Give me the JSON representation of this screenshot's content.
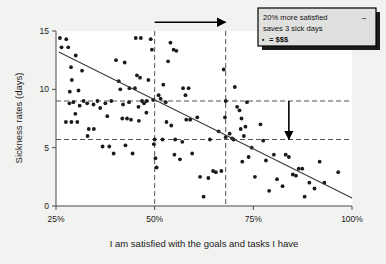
{
  "chart_data": {
    "type": "scatter",
    "title": "",
    "xlabel": "I am satisfied with the goals and tasks I have",
    "ylabel": "Sickness rates (days)",
    "xlim": [
      25,
      100
    ],
    "ylim": [
      0,
      15
    ],
    "xticks": [
      25,
      50,
      75,
      100
    ],
    "xtick_labels": [
      "25%",
      "50%",
      "75%",
      "100%"
    ],
    "yticks": [
      0,
      5,
      10,
      15
    ],
    "ytick_labels": [
      "0",
      "5",
      "10",
      "15"
    ],
    "grid": false,
    "legend": "none",
    "trendline": {
      "name": "linear fit",
      "x": [
        25.7,
        100.0
      ],
      "y": [
        13.2,
        0.68
      ]
    },
    "reference_lines": {
      "horizontal": [
        {
          "y": 9.0,
          "style": "dashed"
        },
        {
          "y": 5.7,
          "style": "dashed"
        }
      ],
      "vertical": [
        {
          "x": 50.0,
          "style": "dashed"
        },
        {
          "x": 68.0,
          "style": "dashed"
        }
      ]
    },
    "annotations": [
      {
        "name": "horizontal-arrow",
        "from": [
          50.0,
          15.75
        ],
        "to": [
          68.0,
          15.75
        ],
        "direction": "right"
      },
      {
        "name": "vertical-arrow",
        "from": [
          84.0,
          9.0
        ],
        "to": [
          84.0,
          5.7
        ],
        "direction": "down"
      }
    ],
    "points": [
      [
        26.0,
        14.4
      ],
      [
        27.6,
        14.3
      ],
      [
        26.4,
        13.6
      ],
      [
        28.1,
        13.6
      ],
      [
        28.8,
        11.9
      ],
      [
        30.0,
        12.9
      ],
      [
        31.6,
        11.6
      ],
      [
        29.0,
        10.8
      ],
      [
        28.5,
        9.8
      ],
      [
        30.7,
        9.9
      ],
      [
        29.4,
        8.9
      ],
      [
        31.0,
        8.6
      ],
      [
        28.4,
        8.8
      ],
      [
        29.9,
        7.9
      ],
      [
        27.5,
        7.2
      ],
      [
        28.9,
        7.2
      ],
      [
        30.4,
        7.2
      ],
      [
        32.9,
        8.8
      ],
      [
        34.5,
        8.7
      ],
      [
        33.3,
        6.6
      ],
      [
        34.6,
        6.6
      ],
      [
        33.0,
        6.0
      ],
      [
        36.2,
        8.4
      ],
      [
        37.5,
        8.8
      ],
      [
        38.0,
        7.7
      ],
      [
        36.8,
        5.1
      ],
      [
        38.5,
        5.1
      ],
      [
        39.6,
        4.5
      ],
      [
        40.2,
        12.5
      ],
      [
        41.3,
        10.0
      ],
      [
        42.4,
        12.3
      ],
      [
        40.9,
        10.7
      ],
      [
        42.0,
        8.7
      ],
      [
        43.6,
        10.1
      ],
      [
        41.8,
        7.5
      ],
      [
        43.0,
        7.5
      ],
      [
        44.0,
        7.4
      ],
      [
        42.6,
        5.2
      ],
      [
        44.4,
        4.5
      ],
      [
        45.2,
        14.4
      ],
      [
        46.5,
        14.4
      ],
      [
        45.5,
        11.2
      ],
      [
        46.3,
        11.0
      ],
      [
        45.0,
        10.1
      ],
      [
        46.8,
        9.0
      ],
      [
        45.9,
        8.5
      ],
      [
        47.3,
        8.8
      ],
      [
        46.0,
        7.3
      ],
      [
        47.9,
        8.0
      ],
      [
        48.4,
        10.8
      ],
      [
        49.0,
        14.3
      ],
      [
        49.3,
        13.4
      ],
      [
        49.6,
        9.1
      ],
      [
        50.0,
        5.7
      ],
      [
        49.8,
        5.3
      ],
      [
        50.2,
        4.1
      ],
      [
        50.5,
        3.3
      ],
      [
        51.0,
        9.5
      ],
      [
        52.2,
        10.4
      ],
      [
        51.5,
        9.2
      ],
      [
        52.8,
        8.9
      ],
      [
        53.4,
        12.4
      ],
      [
        54.0,
        14.0
      ],
      [
        54.8,
        13.4
      ],
      [
        55.5,
        13.3
      ],
      [
        53.0,
        7.2
      ],
      [
        54.2,
        6.9
      ],
      [
        55.0,
        4.4
      ],
      [
        56.4,
        4.0
      ],
      [
        57.2,
        10.1
      ],
      [
        58.6,
        10.1
      ],
      [
        57.8,
        9.5
      ],
      [
        58.0,
        7.4
      ],
      [
        57.0,
        5.5
      ],
      [
        59.5,
        4.5
      ],
      [
        60.8,
        7.6
      ],
      [
        61.5,
        2.5
      ],
      [
        62.4,
        0.8
      ],
      [
        63.6,
        2.4
      ],
      [
        64.8,
        3.0
      ],
      [
        65.5,
        2.9
      ],
      [
        66.2,
        6.4
      ],
      [
        66.9,
        3.0
      ],
      [
        67.5,
        11.7
      ],
      [
        68.0,
        9.0
      ],
      [
        68.0,
        5.9
      ],
      [
        67.8,
        7.6
      ],
      [
        69.0,
        6.2
      ],
      [
        69.6,
        5.8
      ],
      [
        70.3,
        10.2
      ],
      [
        70.9,
        8.5
      ],
      [
        71.5,
        8.2
      ],
      [
        72.0,
        7.5
      ],
      [
        71.8,
        6.6
      ],
      [
        72.6,
        6.0
      ],
      [
        73.4,
        8.9
      ],
      [
        73.0,
        6.8
      ],
      [
        72.2,
        3.8
      ],
      [
        73.8,
        4.2
      ],
      [
        74.6,
        5.0
      ],
      [
        75.4,
        2.5
      ],
      [
        76.8,
        7.0
      ],
      [
        77.5,
        5.6
      ],
      [
        78.2,
        3.9
      ],
      [
        79.0,
        1.3
      ],
      [
        80.2,
        4.4
      ],
      [
        81.0,
        2.3
      ],
      [
        82.4,
        1.7
      ],
      [
        83.2,
        4.4
      ],
      [
        84.0,
        4.2
      ],
      [
        85.0,
        2.7
      ],
      [
        85.8,
        2.6
      ],
      [
        86.5,
        3.2
      ],
      [
        87.4,
        3.2
      ],
      [
        88.0,
        0.8
      ],
      [
        89.2,
        2.0
      ],
      [
        90.5,
        1.5
      ],
      [
        91.8,
        3.8
      ],
      [
        93.0,
        2.0
      ],
      [
        96.5,
        2.9
      ],
      [
        32.0,
        9.0
      ],
      [
        35.5,
        9.0
      ],
      [
        39.0,
        9.0
      ],
      [
        43.5,
        8.9
      ],
      [
        48.0,
        9.0
      ],
      [
        52.0,
        5.7
      ],
      [
        55.2,
        5.7
      ],
      [
        59.0,
        7.4
      ],
      [
        64.0,
        5.7
      ],
      [
        70.0,
        5.7
      ]
    ]
  },
  "annotation_box": {
    "name": "callout-box",
    "lines": [
      "20% more satisfied",
      "saves 3 sick days",
      "= $$$"
    ],
    "arrow_glyph": "→",
    "bullet_glyph": "▪"
  },
  "colors": {
    "figure_background": "#f2f2f1",
    "plot_background": "#ffffff",
    "point": "#1a1a1a",
    "trendline": "#3a3a3a",
    "reference_line": "#555555",
    "axis": "#4a4a4a",
    "text": "#1a1a1a",
    "annotation_box_fill": "#e0e0df",
    "annotation_box_border": "#000000",
    "annotation_box_shadow": "#1c1c1c"
  }
}
